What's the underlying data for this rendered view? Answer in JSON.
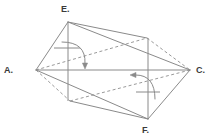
{
  "figure": {
    "shape_kind": "prism-unfolded",
    "stroke_color": "#8a8a8a",
    "hidden_stroke_color": "#9a9a9a",
    "label_color": "#3a3a3a",
    "background_color": "#ffffff",
    "line_width": 1,
    "hidden_dash_pattern": "3,2.5"
  },
  "vertices": [
    {
      "id": "A",
      "label": "A.",
      "x": 36,
      "y": 70,
      "label_x": 4,
      "label_y": 73,
      "visible": true
    },
    {
      "id": "C",
      "label": "C.",
      "x": 190,
      "y": 70,
      "label_x": 196,
      "label_y": 73,
      "visible": true
    },
    {
      "id": "E",
      "label": "E.",
      "x": 68,
      "y": 22,
      "label_x": 61,
      "label_y": 12,
      "visible": true
    },
    {
      "id": "F",
      "label": "F.",
      "x": 148,
      "y": 119,
      "label_x": 142,
      "label_y": 133,
      "visible": true
    },
    {
      "id": "B",
      "label": "",
      "x": 147,
      "y": 38,
      "label_x": 0,
      "label_y": 0,
      "visible": false
    },
    {
      "id": "D",
      "label": "",
      "x": 70,
      "y": 101,
      "label_x": 0,
      "label_y": 0,
      "visible": false
    }
  ],
  "solid_edges": [
    {
      "name": "edge-A-E",
      "from": "A",
      "to": "E"
    },
    {
      "name": "edge-E-C",
      "from": "E",
      "to": "C"
    },
    {
      "name": "edge-A-C",
      "from": "A",
      "to": "C"
    },
    {
      "name": "edge-A-F",
      "from": "A",
      "to": "F"
    },
    {
      "name": "edge-F-C",
      "from": "F",
      "to": "C"
    },
    {
      "name": "edge-E-B",
      "from": "E",
      "to": "B"
    },
    {
      "name": "edge-F-D",
      "from": "F",
      "to": "D"
    }
  ],
  "hidden_edges": [
    {
      "name": "hidden-edge-A-B",
      "from": "A",
      "to": "B"
    },
    {
      "name": "hidden-edge-B-C",
      "from": "B",
      "to": "C"
    },
    {
      "name": "hidden-edge-A-D",
      "from": "A",
      "to": "D"
    },
    {
      "name": "hidden-edge-D-C",
      "from": "D",
      "to": "C"
    }
  ],
  "altitudes": [
    {
      "name": "altitude-from-E",
      "from_vertex": "E",
      "x": 68,
      "y_top": 22,
      "y_bottom": 101,
      "right_angle_tick": {
        "x1": 54,
        "y1": 48,
        "x2": 80,
        "y2": 48
      }
    },
    {
      "name": "altitude-from-F",
      "from_vertex": "F",
      "x": 148,
      "y_top": 38,
      "y_bottom": 119,
      "right_angle_tick": {
        "x1": 136,
        "y1": 92,
        "x2": 160,
        "y2": 92
      }
    }
  ],
  "fold_arrows": [
    {
      "name": "fold-arrow-upper",
      "direction": "clockwise-down",
      "path": "M 62 42 Q 86 42 85 63",
      "arrow_tip_x": 85,
      "arrow_tip_y": 69,
      "arrow_angle_deg": 90
    },
    {
      "name": "fold-arrow-lower",
      "direction": "counterclockwise-left",
      "path": "M 155 99 Q 155 75 136 75",
      "arrow_tip_x": 130,
      "arrow_tip_y": 75,
      "arrow_angle_deg": 180
    }
  ]
}
